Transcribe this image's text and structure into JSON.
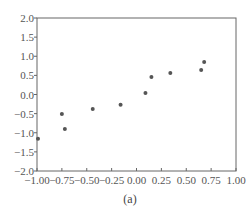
{
  "chart_data": {
    "type": "scatter",
    "title": "",
    "caption": "(a)",
    "xlabel": "",
    "ylabel": "",
    "xlim": [
      -1.0,
      1.0
    ],
    "ylim": [
      -2.0,
      2.0
    ],
    "grid": false,
    "legend": null,
    "x_ticks": [
      "-1.00",
      "-0.75",
      "-0.50",
      "-0.25",
      "0.00",
      "0.25",
      "0.50",
      "0.75",
      "1.00"
    ],
    "y_ticks": [
      "2.0",
      "1.5",
      "1.0",
      "0.5",
      "0.0",
      "-0.5",
      "-1.0",
      "-1.5",
      "-2.0"
    ],
    "series": [
      {
        "name": "points",
        "color": "#555555",
        "x": [
          -0.99,
          -0.75,
          -0.72,
          -0.44,
          -0.16,
          0.09,
          0.15,
          0.34,
          0.65,
          0.68
        ],
        "y": [
          -1.16,
          -0.51,
          -0.9,
          -0.38,
          -0.27,
          0.04,
          0.46,
          0.56,
          0.64,
          0.85
        ]
      }
    ]
  },
  "colors": {
    "axis": "#666666",
    "point": "#555555",
    "background": "#ffffff"
  }
}
